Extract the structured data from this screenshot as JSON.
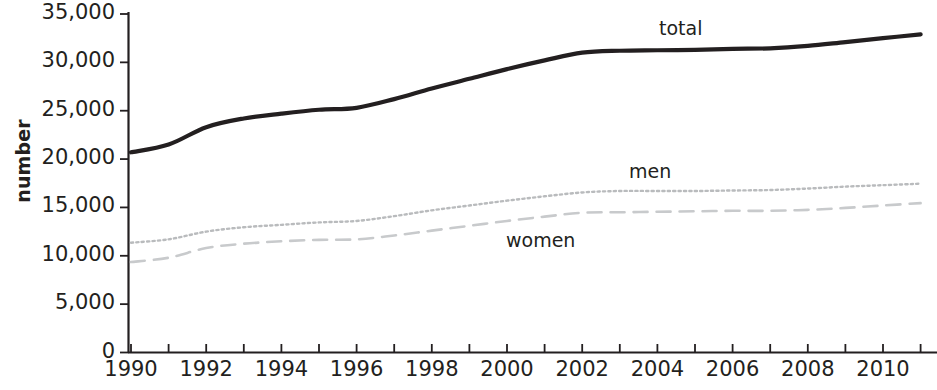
{
  "chart_data": {
    "type": "line",
    "title": "",
    "subtitle": "",
    "xlabel": "",
    "ylabel": "number",
    "grid": false,
    "legend_position": "inline-annotations",
    "xlim": [
      1990,
      2011
    ],
    "ylim": [
      0,
      35000
    ],
    "y_ticks": [
      0,
      5000,
      10000,
      15000,
      20000,
      25000,
      30000,
      35000
    ],
    "y_tick_labels": [
      "0",
      "5,000",
      "10,000",
      "15,000",
      "20,000",
      "25,000",
      "30,000",
      "35,000"
    ],
    "x_ticks": [
      1990,
      1991,
      1992,
      1993,
      1994,
      1995,
      1996,
      1997,
      1998,
      1999,
      2000,
      2001,
      2002,
      2003,
      2004,
      2005,
      2006,
      2007,
      2008,
      2009,
      2010,
      2011
    ],
    "x_tick_labels_shown": [
      "1990",
      "1992",
      "1994",
      "1996",
      "1998",
      "2000",
      "2002",
      "2004",
      "2006",
      "2008",
      "2010"
    ],
    "x": [
      1990,
      1991,
      1992,
      1993,
      1994,
      1995,
      1996,
      1997,
      1998,
      1999,
      2000,
      2001,
      2002,
      2003,
      2004,
      2005,
      2006,
      2007,
      2008,
      2009,
      2010,
      2011
    ],
    "series": [
      {
        "name": "total",
        "style": "solid-thick-black",
        "color": "#231f20",
        "values": [
          20700,
          21500,
          23300,
          24200,
          24700,
          25100,
          25300,
          26200,
          27300,
          28300,
          29300,
          30200,
          31000,
          31200,
          31250,
          31300,
          31400,
          31450,
          31700,
          32100,
          32500,
          32900
        ]
      },
      {
        "name": "men",
        "style": "dotted-grey",
        "color": "#b9bbbd",
        "values": [
          11350,
          11700,
          12500,
          12950,
          13200,
          13450,
          13600,
          14100,
          14700,
          15200,
          15700,
          16150,
          16550,
          16700,
          16700,
          16700,
          16750,
          16800,
          16950,
          17150,
          17300,
          17450
        ]
      },
      {
        "name": "women",
        "style": "dashed-grey",
        "color": "#c8cacc",
        "values": [
          9350,
          9800,
          10800,
          11250,
          11500,
          11650,
          11700,
          12100,
          12600,
          13100,
          13600,
          14050,
          14450,
          14500,
          14550,
          14600,
          14650,
          14650,
          14750,
          14950,
          15200,
          15450
        ]
      }
    ],
    "annotations": [
      {
        "text": "total",
        "series": "total"
      },
      {
        "text": "men",
        "series": "men"
      },
      {
        "text": "women",
        "series": "women"
      }
    ]
  },
  "axis": {
    "y_label": "number",
    "y_tick_labels": [
      "35,000",
      "30,000",
      "25,000",
      "20,000",
      "15,000",
      "10,000",
      "5,000",
      "0"
    ],
    "x_tick_labels": [
      "1990",
      "1992",
      "1994",
      "1996",
      "1998",
      "2000",
      "2002",
      "2004",
      "2006",
      "2008",
      "2010"
    ]
  },
  "labels": {
    "total": "total",
    "men": "men",
    "women": "women"
  }
}
